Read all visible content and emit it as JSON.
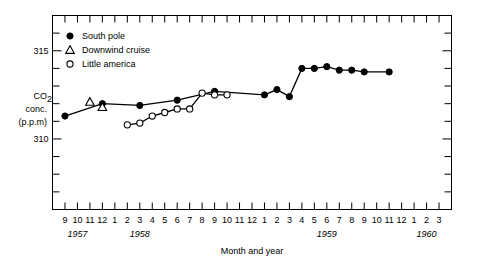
{
  "chart_data": {
    "type": "line",
    "title": "",
    "xlabel": "Month and year",
    "ylabel": "CO2 conc. (p.p.m)",
    "ylabel_lines": [
      "CO",
      "2",
      "conc.",
      "(p.p.m)"
    ],
    "ylim": [
      306,
      317
    ],
    "ytick_labels": [
      "315",
      "310"
    ],
    "ytick_values": [
      315,
      310
    ],
    "yticks_minor_step": 1,
    "grid": false,
    "legend_position": "top-left",
    "x_axis": {
      "months": [
        9,
        10,
        11,
        12,
        1,
        2,
        3,
        4,
        5,
        6,
        7,
        8,
        9,
        10,
        11,
        12,
        1,
        2,
        3,
        4,
        5,
        6,
        7,
        8,
        9,
        10,
        11,
        12,
        1,
        2,
        3
      ],
      "year_labels": [
        "1957",
        "1958",
        "1959",
        "1960"
      ],
      "year_label_index": [
        1,
        6,
        21,
        29
      ],
      "start": "9/1957",
      "end": "3/1960"
    },
    "series": [
      {
        "name": "South pole",
        "marker": "filled-circle",
        "line": true,
        "points": [
          {
            "month": 9,
            "year": 1957,
            "index": 0,
            "value": 311.3
          },
          {
            "month": 12,
            "year": 1957,
            "index": 3,
            "value": 312.0
          },
          {
            "month": 3,
            "year": 1958,
            "index": 6,
            "value": 311.9
          },
          {
            "month": 6,
            "year": 1958,
            "index": 9,
            "value": 312.2
          },
          {
            "month": 9,
            "year": 1958,
            "index": 12,
            "value": 312.7
          },
          {
            "month": 1,
            "year": 1959,
            "index": 16,
            "value": 312.5
          },
          {
            "month": 2,
            "year": 1959,
            "index": 17,
            "value": 312.8
          },
          {
            "month": 3,
            "year": 1959,
            "index": 18,
            "value": 312.4
          },
          {
            "month": 4,
            "year": 1959,
            "index": 19,
            "value": 314.0
          },
          {
            "month": 5,
            "year": 1959,
            "index": 20,
            "value": 314.0
          },
          {
            "month": 6,
            "year": 1959,
            "index": 21,
            "value": 314.1
          },
          {
            "month": 7,
            "year": 1959,
            "index": 22,
            "value": 313.9
          },
          {
            "month": 8,
            "year": 1959,
            "index": 23,
            "value": 313.9
          },
          {
            "month": 9,
            "year": 1959,
            "index": 24,
            "value": 313.8
          },
          {
            "month": 11,
            "year": 1959,
            "index": 26,
            "value": 313.8
          }
        ]
      },
      {
        "name": "Downwind cruise",
        "marker": "open-triangle",
        "line": false,
        "points": [
          {
            "month": 11,
            "year": 1957,
            "index": 2,
            "value": 312.1
          },
          {
            "month": 12,
            "year": 1957,
            "index": 3,
            "value": 311.8
          }
        ]
      },
      {
        "name": "Little america",
        "marker": "open-circle",
        "line": true,
        "points": [
          {
            "month": 2,
            "year": 1958,
            "index": 5,
            "value": 310.8
          },
          {
            "month": 3,
            "year": 1958,
            "index": 6,
            "value": 310.9
          },
          {
            "month": 4,
            "year": 1958,
            "index": 7,
            "value": 311.3
          },
          {
            "month": 5,
            "year": 1958,
            "index": 8,
            "value": 311.5
          },
          {
            "month": 6,
            "year": 1958,
            "index": 9,
            "value": 311.7
          },
          {
            "month": 7,
            "year": 1958,
            "index": 10,
            "value": 311.7
          },
          {
            "month": 8,
            "year": 1958,
            "index": 11,
            "value": 312.6
          },
          {
            "month": 9,
            "year": 1958,
            "index": 12,
            "value": 312.5
          },
          {
            "month": 10,
            "year": 1958,
            "index": 13,
            "value": 312.5
          }
        ]
      }
    ],
    "legend": [
      {
        "label": "South pole",
        "marker": "filled-circle"
      },
      {
        "label": "Downwind cruise",
        "marker": "open-triangle"
      },
      {
        "label": "Little america",
        "marker": "open-circle"
      }
    ],
    "colors": {
      "line": "#000000",
      "marker": "#000000",
      "axis": "#000000",
      "background": "#ffffff"
    }
  }
}
